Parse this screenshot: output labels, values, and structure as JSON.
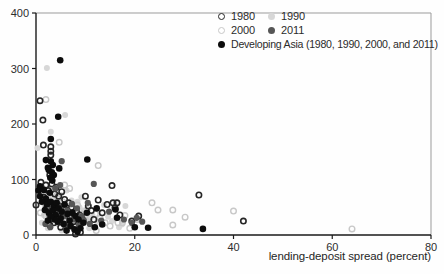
{
  "chart_data": {
    "type": "scatter",
    "title": "",
    "xlabel": "lending-deposit spread (percent)",
    "ylabel": "",
    "xlim": [
      0,
      80
    ],
    "ylim": [
      0,
      400
    ],
    "x_ticks": [
      0,
      20,
      40,
      60,
      80
    ],
    "y_ticks": [
      0,
      100,
      200,
      300,
      400
    ],
    "grid": false,
    "legend_position": "top-right-inside",
    "frame": {
      "axis_color": "#1a1a1a",
      "box_color": "#9b9b9b"
    },
    "series": [
      {
        "name": "1980",
        "marker": "open-circle",
        "color": "#262626",
        "radius": 2.7,
        "stroke_width": 1.6,
        "points": [
          [
            0.8,
            242
          ],
          [
            1.4,
            207
          ],
          [
            1.5,
            162
          ],
          [
            3,
            159
          ],
          [
            3,
            151
          ],
          [
            3,
            144
          ],
          [
            2.8,
            108
          ],
          [
            0,
            54
          ],
          [
            1,
            95
          ],
          [
            2,
            90
          ],
          [
            3.2,
            92
          ],
          [
            4.1,
            86
          ],
          [
            2.5,
            80
          ],
          [
            3.8,
            74
          ],
          [
            1.6,
            68
          ],
          [
            4.6,
            70
          ],
          [
            5.2,
            78
          ],
          [
            5.8,
            64
          ],
          [
            2.2,
            50
          ],
          [
            3.4,
            56
          ],
          [
            4.8,
            52
          ],
          [
            6,
            46
          ],
          [
            6.6,
            58
          ],
          [
            7.2,
            50
          ],
          [
            5.4,
            38
          ],
          [
            6.8,
            32
          ],
          [
            4.2,
            30
          ],
          [
            3.6,
            22
          ],
          [
            2.8,
            18
          ],
          [
            5,
            14
          ],
          [
            7.6,
            24
          ],
          [
            8.2,
            42
          ],
          [
            8.8,
            36
          ],
          [
            9.4,
            28
          ],
          [
            10,
            70
          ],
          [
            10.6,
            52
          ],
          [
            11.2,
            44
          ],
          [
            12.6,
            63
          ],
          [
            13.4,
            40
          ],
          [
            11.7,
            28
          ],
          [
            14.4,
            55
          ],
          [
            15.4,
            89
          ],
          [
            15.6,
            58
          ],
          [
            16.4,
            58
          ],
          [
            16,
            49
          ],
          [
            17,
            36
          ],
          [
            19.4,
            25
          ],
          [
            20.8,
            34
          ],
          [
            9,
            5
          ],
          [
            8,
            2
          ],
          [
            33,
            72
          ],
          [
            42,
            25
          ]
        ]
      },
      {
        "name": "1990",
        "marker": "filled-circle",
        "color": "#d7d7d7",
        "radius": 3.0,
        "stroke_width": 0,
        "points": [
          [
            2.2,
            301
          ],
          [
            3,
            186
          ],
          [
            5.9,
            216
          ],
          [
            0.3,
            157
          ],
          [
            1.2,
            22
          ],
          [
            1,
            75
          ],
          [
            2,
            62
          ],
          [
            3,
            70
          ],
          [
            4,
            64
          ],
          [
            5,
            72
          ],
          [
            2.6,
            48
          ],
          [
            3.6,
            42
          ],
          [
            4.6,
            38
          ],
          [
            5.6,
            48
          ],
          [
            6.6,
            42
          ],
          [
            7.6,
            36
          ],
          [
            3.2,
            30
          ],
          [
            4.4,
            20
          ],
          [
            6,
            26
          ],
          [
            7,
            18
          ],
          [
            8,
            22
          ],
          [
            8.8,
            50
          ],
          [
            9.6,
            44
          ],
          [
            10.4,
            30
          ],
          [
            11.4,
            36
          ],
          [
            12.4,
            24
          ],
          [
            13.8,
            54
          ],
          [
            15.4,
            25
          ],
          [
            17.4,
            19
          ],
          [
            18.1,
            52
          ],
          [
            8.4,
            60
          ],
          [
            9.2,
            68
          ],
          [
            6.2,
            80
          ],
          [
            7.2,
            62
          ],
          [
            5.2,
            8
          ],
          [
            10.8,
            12
          ],
          [
            14.6,
            33
          ],
          [
            16.8,
            14
          ],
          [
            2.4,
            12
          ],
          [
            1.6,
            36
          ]
        ]
      },
      {
        "name": "2000",
        "marker": "open-circle",
        "color": "#c8c8c8",
        "radius": 2.8,
        "stroke_width": 1.4,
        "points": [
          [
            2,
            244
          ],
          [
            4.7,
            167
          ],
          [
            12.6,
            125
          ],
          [
            1.4,
            84
          ],
          [
            2.4,
            72
          ],
          [
            3.4,
            78
          ],
          [
            4.4,
            66
          ],
          [
            5.4,
            60
          ],
          [
            6.4,
            52
          ],
          [
            7.4,
            46
          ],
          [
            8.4,
            54
          ],
          [
            9.4,
            38
          ],
          [
            10.4,
            46
          ],
          [
            2,
            34
          ],
          [
            3,
            26
          ],
          [
            4,
            40
          ],
          [
            5,
            44
          ],
          [
            6,
            34
          ],
          [
            7,
            28
          ],
          [
            8,
            16
          ],
          [
            9,
            20
          ],
          [
            10,
            26
          ],
          [
            11,
            32
          ],
          [
            12,
            38
          ],
          [
            13,
            30
          ],
          [
            14,
            22
          ],
          [
            15,
            16
          ],
          [
            16.6,
            22
          ],
          [
            17.5,
            22
          ],
          [
            18,
            35
          ],
          [
            19,
            12
          ],
          [
            20.5,
            28
          ],
          [
            5.8,
            90
          ],
          [
            6.8,
            84
          ],
          [
            1.8,
            56
          ],
          [
            0.9,
            40
          ],
          [
            12.2,
            8
          ],
          [
            23.5,
            58
          ],
          [
            24.7,
            45
          ],
          [
            27.7,
            45
          ],
          [
            27.7,
            18
          ],
          [
            30.2,
            32
          ],
          [
            40,
            43
          ],
          [
            64,
            11
          ]
        ]
      },
      {
        "name": "2011",
        "marker": "filled-circle",
        "color": "#565656",
        "radius": 3.1,
        "stroke_width": 0,
        "points": [
          [
            5.2,
            133
          ],
          [
            11.7,
            92
          ],
          [
            10.5,
            58
          ],
          [
            9.3,
            34
          ],
          [
            19.4,
            22
          ],
          [
            20.4,
            31
          ],
          [
            1.3,
            66
          ],
          [
            2.3,
            58
          ],
          [
            3.3,
            50
          ],
          [
            4.3,
            46
          ],
          [
            5.3,
            52
          ],
          [
            6.3,
            44
          ],
          [
            7.3,
            56
          ],
          [
            8.3,
            48
          ],
          [
            2.7,
            36
          ],
          [
            3.7,
            32
          ],
          [
            4.7,
            26
          ],
          [
            5.7,
            34
          ],
          [
            6.7,
            22
          ],
          [
            7.7,
            28
          ],
          [
            8.7,
            18
          ],
          [
            9.7,
            26
          ],
          [
            1.9,
            20
          ],
          [
            2.9,
            14
          ],
          [
            6.1,
            14
          ],
          [
            10.9,
            20
          ],
          [
            13.2,
            26
          ],
          [
            14.8,
            42
          ],
          [
            4.9,
            90
          ],
          [
            3.9,
            84
          ],
          [
            17.8,
            28
          ],
          [
            21.5,
            24
          ]
        ]
      },
      {
        "name": "Developing Asia (1980, 1990, 2000, and 2011)",
        "marker": "filled-circle",
        "color": "#0c0c0c",
        "radius": 3.3,
        "stroke_width": 0,
        "points": [
          [
            4.9,
            315
          ],
          [
            4.5,
            213
          ],
          [
            3,
            173
          ],
          [
            10.4,
            136
          ],
          [
            0.5,
            80
          ],
          [
            2,
            135
          ],
          [
            3,
            133
          ],
          [
            3.4,
            126
          ],
          [
            4.7,
            120
          ],
          [
            2.4,
            121
          ],
          [
            2.6,
            117
          ],
          [
            3.2,
            113
          ],
          [
            3.6,
            108
          ],
          [
            2.9,
            103
          ],
          [
            3.3,
            98
          ],
          [
            0.8,
            88
          ],
          [
            1.6,
            81
          ],
          [
            0.8,
            70
          ],
          [
            2,
            65
          ],
          [
            2.8,
            76
          ],
          [
            1.2,
            60
          ],
          [
            2.2,
            55
          ],
          [
            3,
            60
          ],
          [
            3.6,
            52
          ],
          [
            4.2,
            58
          ],
          [
            1.8,
            45
          ],
          [
            2.6,
            40
          ],
          [
            3.4,
            44
          ],
          [
            4,
            36
          ],
          [
            4.6,
            48
          ],
          [
            5.2,
            42
          ],
          [
            5.8,
            55
          ],
          [
            6.4,
            38
          ],
          [
            5,
            30
          ],
          [
            4.4,
            24
          ],
          [
            3.8,
            28
          ],
          [
            3,
            33
          ],
          [
            2.4,
            26
          ],
          [
            5.6,
            20
          ],
          [
            6.8,
            26
          ],
          [
            7.4,
            40
          ],
          [
            8,
            34
          ],
          [
            8.6,
            28
          ],
          [
            7,
            16
          ],
          [
            7.8,
            10
          ],
          [
            8.4,
            6
          ],
          [
            9,
            12
          ],
          [
            6.2,
            8
          ],
          [
            9.6,
            22
          ],
          [
            10.3,
            40
          ],
          [
            12.3,
            48
          ],
          [
            16.1,
            46
          ],
          [
            11.9,
            14
          ],
          [
            13.4,
            19
          ],
          [
            16.4,
            31
          ],
          [
            20,
            14
          ],
          [
            22.7,
            13
          ],
          [
            33.8,
            11
          ]
        ]
      }
    ]
  }
}
